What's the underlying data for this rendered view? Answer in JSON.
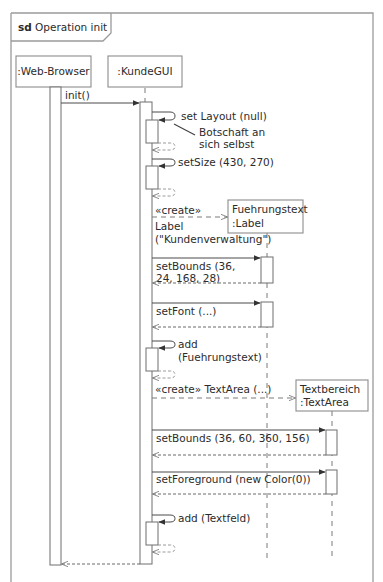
{
  "frame": {
    "keyword": "sd",
    "title": "Operation init"
  },
  "lifelines": [
    {
      "id": "web-browser",
      "label": ":Web-Browser"
    },
    {
      "id": "kunde-gui",
      "label": ":KundeGUI"
    },
    {
      "id": "fuehrungstext",
      "label_line1": "Fuehrungstext",
      "label_line2": ":Label"
    },
    {
      "id": "textbereich",
      "label_line1": "Textbereich",
      "label_line2": ":TextArea"
    }
  ],
  "messages": {
    "init": "init()",
    "set_layout": "set Layout (null)",
    "note_line1": "Botschaft an",
    "note_line2": "sich selbst",
    "set_size": "setSize (430, 270)",
    "create1_stereotype": "«create»",
    "create1_line1": "Label",
    "create1_line2": "(\"Kundenverwaltung\")",
    "set_bounds1_line1": "setBounds (36,",
    "set_bounds1_line2": "24, 168, 28)",
    "set_font": "setFont (...)",
    "add1_line1": "add",
    "add1_line2": "(Fuehrungstext)",
    "create2": "«create» TextArea (...)",
    "set_bounds2": "setBounds (36, 60, 360, 156)",
    "set_foreground": "setForeground (new Color(0))",
    "add2": "add (Textfeld)"
  },
  "colors": {
    "frame": "#9a9a9a",
    "text": "#2b2b2b",
    "line": "#4a4a4a"
  }
}
